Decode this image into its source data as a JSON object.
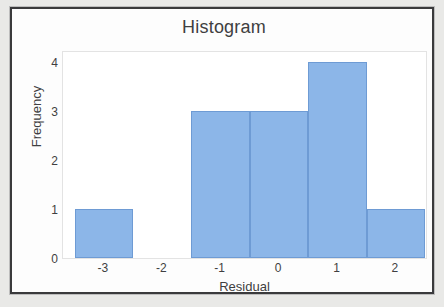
{
  "chart_data": {
    "type": "bar",
    "title": "Histogram",
    "xlabel": "Residual",
    "ylabel": "Frequency",
    "categories": [
      "-3",
      "-2",
      "-1",
      "0",
      "1",
      "2"
    ],
    "bin_centers": [
      -3,
      -2,
      -1,
      0,
      1,
      2
    ],
    "bin_width": 1,
    "values": [
      1,
      0,
      3,
      3,
      4,
      1
    ],
    "xtick_labels": [
      "-3",
      "-2",
      "-1",
      "0",
      "1",
      "2"
    ],
    "ytick_labels": [
      "0",
      "1",
      "2",
      "3",
      "4"
    ],
    "ytick_values": [
      0,
      1,
      2,
      3,
      4
    ],
    "xlim": [
      -3.7,
      2.55
    ],
    "ylim": [
      0,
      4.25
    ],
    "grid": false,
    "legend": false,
    "bar_color": "#8cb6e8",
    "bar_edge_color": "#6e9bd4",
    "plot_border_color": "#e3e3e3",
    "frame_color": "#3a3a3c",
    "text_color": "#3f3f41"
  }
}
